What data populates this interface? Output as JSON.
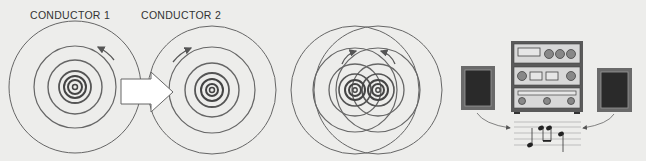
{
  "labels": {
    "conductor1": "CONDUCTOR  1",
    "conductor2": "CONDUCTOR  2"
  },
  "figures": [
    {
      "name": "conductor-1-field",
      "center": [
        75,
        87
      ],
      "direction": "counterclockwise"
    },
    {
      "name": "conductor-2-field",
      "center": [
        212,
        90
      ],
      "direction": "clockwise"
    },
    {
      "name": "interacting-fields",
      "centers": [
        [
          355,
          90
        ],
        [
          378,
          90
        ]
      ]
    },
    {
      "name": "stereo-system",
      "components": [
        "left-speaker",
        "amplifier-stack",
        "right-speaker",
        "music-notes"
      ]
    }
  ],
  "colors": {
    "background": "#ededeb",
    "line": "#555555",
    "arrow_fill": "#ffffff",
    "speaker_outer": "#6a6a6a",
    "speaker_inner": "#2a2a2a",
    "knob": "#888888"
  }
}
